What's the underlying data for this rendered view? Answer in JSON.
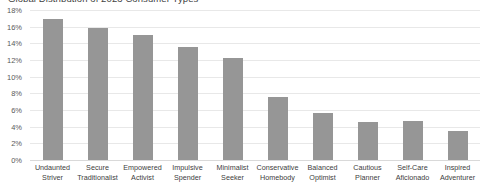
{
  "chart_data": {
    "type": "bar",
    "title": "Global Distribution of 2023 Consumer Types",
    "xlabel": "",
    "ylabel": "",
    "ylim": [
      0,
      18
    ],
    "ytick_labels": [
      "18%",
      "16%",
      "14%",
      "12%",
      "10%",
      "8%",
      "6%",
      "4%",
      "2%",
      "0%"
    ],
    "ytick_values": [
      18,
      16,
      14,
      12,
      10,
      8,
      6,
      4,
      2,
      0
    ],
    "grid": true,
    "legend": "none",
    "bar_color": "#969696",
    "categories": [
      "Undaunted Striver",
      "Secure Traditionalist",
      "Empowered Activist",
      "Impulsive Spender",
      "Minimalist Seeker",
      "Conservative Homebody",
      "Balanced Optimist",
      "Cautious Planner",
      "Self-Care Aficionado",
      "Inspired Adventurer"
    ],
    "category_lines": [
      [
        "Undaunted",
        "Striver"
      ],
      [
        "Secure",
        "Traditionalist"
      ],
      [
        "Empowered",
        "Activist"
      ],
      [
        "Impulsive",
        "Spender"
      ],
      [
        "Minimalist",
        "Seeker"
      ],
      [
        "Conservative",
        "Homebody"
      ],
      [
        "Balanced",
        "Optimist"
      ],
      [
        "Cautious",
        "Planner"
      ],
      [
        "Self-Care",
        "Aficionado"
      ],
      [
        "Inspired",
        "Adventurer"
      ]
    ],
    "values": [
      16.9,
      15.8,
      15.0,
      13.6,
      12.2,
      7.6,
      5.7,
      4.6,
      4.7,
      3.5
    ]
  }
}
